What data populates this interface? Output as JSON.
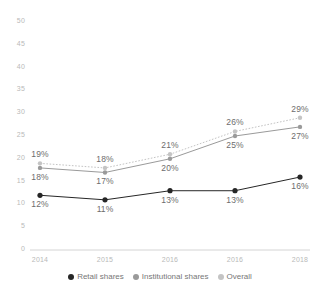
{
  "chart_data": {
    "type": "line",
    "title": "",
    "subtitle": "",
    "xlabel": "",
    "ylabel": "",
    "ylim": [
      0,
      50
    ],
    "yticks": [
      0,
      5,
      10,
      15,
      20,
      25,
      30,
      35,
      40,
      45,
      50
    ],
    "ytick_labels": [
      "0",
      "5",
      "10",
      "15",
      "20",
      "25",
      "30",
      "35",
      "40",
      "45",
      "50"
    ],
    "grid": false,
    "legend_position": "bottom",
    "categories": [
      "2014",
      "2015",
      "2016",
      "2016",
      "2018"
    ],
    "series": [
      {
        "name": "Retail shares",
        "values": [
          12,
          11,
          13,
          13,
          16
        ],
        "labels": [
          "12%",
          "11%",
          "13%",
          "13%",
          "16%"
        ],
        "color": "#262626",
        "line_style": "solid",
        "label_position": "below"
      },
      {
        "name": "Institutional shares",
        "values": [
          18,
          17,
          20,
          25,
          27
        ],
        "labels": [
          "18%",
          "17%",
          "20%",
          "25%",
          "27%"
        ],
        "color": "#9a9a9a",
        "line_style": "solid",
        "label_position": "below"
      },
      {
        "name": "Overall",
        "values": [
          19,
          18,
          21,
          26,
          29
        ],
        "labels": [
          "19%",
          "18%",
          "21%",
          "26%",
          "29%"
        ],
        "color": "#c4c4c4",
        "line_style": "dotted",
        "label_position": "above"
      }
    ]
  },
  "axis": {
    "baseline_color": "#d4d4d4",
    "tick_text_color": "#b9b9b9"
  },
  "legend": {
    "items": [
      {
        "label": "Retail shares",
        "color": "#262626"
      },
      {
        "label": "Institutional shares",
        "color": "#9a9a9a"
      },
      {
        "label": "Overall",
        "color": "#c4c4c4"
      }
    ]
  }
}
